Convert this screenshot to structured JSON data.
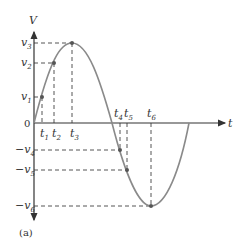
{
  "figure": {
    "caption": "(a)",
    "axes": {
      "y_label": "V",
      "x_label": "t",
      "origin_label": "0"
    },
    "y_ticks": [
      {
        "name": "v",
        "sub": "3",
        "neg": false
      },
      {
        "name": "v",
        "sub": "2",
        "neg": false
      },
      {
        "name": "v",
        "sub": "1",
        "neg": false
      },
      {
        "name": "v",
        "sub": "4",
        "neg": true
      },
      {
        "name": "v",
        "sub": "5",
        "neg": true
      },
      {
        "name": "v",
        "sub": "6",
        "neg": true
      }
    ],
    "x_ticks": [
      {
        "name": "t",
        "sub": "1"
      },
      {
        "name": "t",
        "sub": "2"
      },
      {
        "name": "t",
        "sub": "3"
      },
      {
        "name": "t",
        "sub": "4"
      },
      {
        "name": "t",
        "sub": "5"
      },
      {
        "name": "t",
        "sub": "6"
      }
    ],
    "curve": "sine wave: voltage V versus time t, one full cycle",
    "colors": {
      "curve": "#8a8a8a",
      "axes": "#333333",
      "dashed": "#555555",
      "points": "#555555"
    }
  }
}
